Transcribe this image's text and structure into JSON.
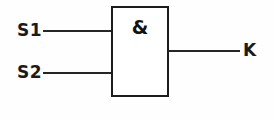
{
  "diagram": {
    "type": "logic-gate-schematic",
    "background_color": "#fefefe",
    "line_color": "#262626",
    "text_color": "#1a1a1a",
    "gate": {
      "symbol": "&",
      "function": "AND",
      "box": {
        "x": 111,
        "y": 6,
        "width": 58,
        "height": 91
      }
    },
    "inputs": [
      {
        "label": "S1",
        "wire_y": 30,
        "wire_x_start": 43,
        "wire_x_end": 111
      },
      {
        "label": "S2",
        "wire_y": 72,
        "wire_x_start": 43,
        "wire_x_end": 111
      }
    ],
    "outputs": [
      {
        "label": "K",
        "wire_y": 50,
        "wire_x_start": 169,
        "wire_x_end": 240
      }
    ]
  }
}
